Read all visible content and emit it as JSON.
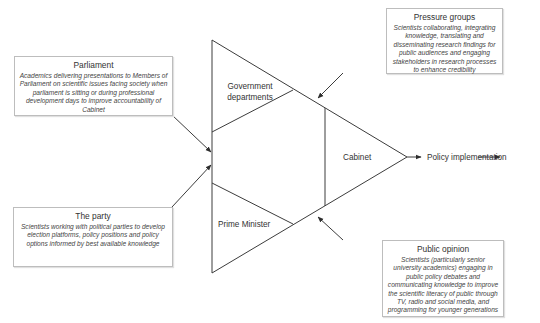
{
  "center": {
    "government_departments": [
      "Government",
      "departments"
    ],
    "prime_minister": "Prime Minister",
    "cabinet": "Cabinet",
    "output": "Policy implementation"
  },
  "influences": {
    "parliament": {
      "title": "Parliament",
      "description": "Academics delivering presentations to Members of Parliament on scientific issues facing society when parliament is sitting or during professional development days to improve accountability of Cabinet"
    },
    "the_party": {
      "title": "The party",
      "description": "Scientists working with political parties to develop election platforms, policy positions and policy options informed by best available knowledge"
    },
    "pressure_groups": {
      "title": "Pressure groups",
      "description": "Scientists collaborating, integrating knowledge, translating and disseminating research findings for public audiences and engaging stakeholders in research processes to enhance credibility"
    },
    "public_opinion": {
      "title": "Public opinion",
      "description": "Scientists (particularly senior university academics) engaging in public policy debates and communicating knowledge to improve the scientific literacy of public through TV, radio and social media, and programming for younger generations"
    }
  },
  "colors": {
    "line": "#3c3c3c",
    "border": "#bdbdbd",
    "text": "#333333"
  }
}
